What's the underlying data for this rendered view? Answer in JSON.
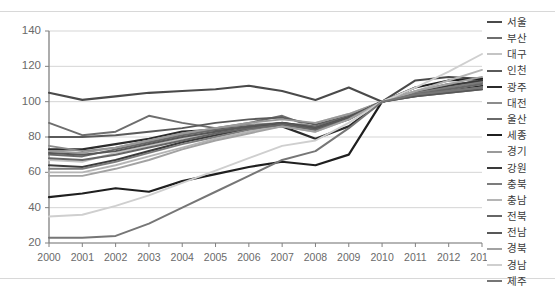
{
  "chart_data": {
    "type": "line",
    "title": "",
    "xlabel": "",
    "ylabel": "",
    "x": [
      2000,
      2001,
      2002,
      2003,
      2004,
      2005,
      2006,
      2007,
      2008,
      2009,
      2010,
      2011,
      2012,
      2013
    ],
    "categories": [
      "2000",
      "2001",
      "2002",
      "2003",
      "2004",
      "2005",
      "2006",
      "2007",
      "2008",
      "2009",
      "2010",
      "2011",
      "2012",
      "2013"
    ],
    "ylim": [
      20,
      140
    ],
    "yticks": [
      20,
      40,
      60,
      80,
      100,
      120,
      140
    ],
    "ytick_labels": [
      "20",
      "40",
      "60",
      "80",
      "100",
      "120",
      "140"
    ],
    "grid": true,
    "grid_axis": "y",
    "legend_position": "right",
    "index_year": 2010,
    "index_value": 100,
    "series": [
      {
        "name": "서울",
        "color": "#4a4a4a",
        "width": 2.1,
        "values": [
          105,
          101,
          103,
          105,
          106,
          107,
          109,
          106,
          101,
          108,
          100,
          112,
          114,
          113
        ]
      },
      {
        "name": "부산",
        "color": "#6e6e6e",
        "width": 1.9,
        "values": [
          88,
          81,
          83,
          92,
          88,
          85,
          88,
          92,
          85,
          91,
          100,
          104,
          108,
          113
        ]
      },
      {
        "name": "대구",
        "color": "#c4c4c4",
        "width": 1.9,
        "values": [
          67,
          66,
          71,
          75,
          79,
          83,
          84,
          86,
          88,
          93,
          100,
          104,
          109,
          111
        ]
      },
      {
        "name": "인천",
        "color": "#5a5a5a",
        "width": 1.9,
        "values": [
          80,
          80,
          81,
          83,
          85,
          88,
          90,
          91,
          87,
          92,
          100,
          106,
          110,
          111
        ]
      },
      {
        "name": "광주",
        "color": "#2b2b2b",
        "width": 2.2,
        "values": [
          73,
          73,
          76,
          79,
          83,
          84,
          86,
          86,
          79,
          86,
          100,
          104,
          106,
          109
        ]
      },
      {
        "name": "대전",
        "color": "#8c8c8c",
        "width": 1.9,
        "values": [
          75,
          72,
          74,
          78,
          82,
          85,
          87,
          88,
          86,
          91,
          100,
          103,
          106,
          108
        ]
      },
      {
        "name": "울산",
        "color": "#6a6a6a",
        "width": 1.9,
        "values": [
          70,
          69,
          73,
          77,
          81,
          84,
          86,
          88,
          86,
          92,
          100,
          103,
          105,
          107
        ]
      },
      {
        "name": "세종",
        "color": "#1f1f1f",
        "width": 2.2,
        "values": [
          46,
          48,
          51,
          49,
          55,
          59,
          63,
          66,
          64,
          70,
          100,
          108,
          112,
          113
        ]
      },
      {
        "name": "경기",
        "color": "#9a9a9a",
        "width": 1.9,
        "values": [
          72,
          71,
          74,
          78,
          82,
          85,
          88,
          90,
          88,
          93,
          100,
          104,
          107,
          110
        ]
      },
      {
        "name": "강원",
        "color": "#3a3a3a",
        "width": 2.1,
        "values": [
          64,
          63,
          67,
          72,
          77,
          81,
          85,
          88,
          85,
          91,
          100,
          105,
          109,
          112
        ]
      },
      {
        "name": "충북",
        "color": "#7c7c7c",
        "width": 1.9,
        "values": [
          62,
          62,
          66,
          71,
          76,
          80,
          84,
          87,
          84,
          90,
          100,
          105,
          108,
          111
        ]
      },
      {
        "name": "충남",
        "color": "#b5b5b5",
        "width": 1.9,
        "values": [
          60,
          60,
          64,
          69,
          74,
          79,
          83,
          86,
          83,
          90,
          100,
          106,
          112,
          118
        ]
      },
      {
        "name": "전북",
        "color": "#666666",
        "width": 2.0,
        "values": [
          68,
          67,
          70,
          74,
          78,
          82,
          85,
          87,
          84,
          90,
          100,
          104,
          107,
          110
        ]
      },
      {
        "name": "전남",
        "color": "#585858",
        "width": 2.0,
        "values": [
          71,
          70,
          72,
          76,
          80,
          83,
          86,
          88,
          85,
          91,
          100,
          103,
          105,
          107
        ]
      },
      {
        "name": "경북",
        "color": "#a2a2a2",
        "width": 1.9,
        "values": [
          58,
          58,
          62,
          67,
          73,
          78,
          82,
          86,
          83,
          90,
          100,
          106,
          110,
          114
        ]
      },
      {
        "name": "경남",
        "color": "#cfcfcf",
        "width": 1.9,
        "values": [
          35,
          36,
          41,
          47,
          54,
          61,
          68,
          75,
          78,
          88,
          100,
          108,
          117,
          127
        ]
      },
      {
        "name": "제주",
        "color": "#767676",
        "width": 2.0,
        "values": [
          23,
          23,
          24,
          31,
          40,
          49,
          58,
          67,
          72,
          85,
          100,
          104,
          106,
          108
        ]
      }
    ]
  },
  "axis": {
    "y_label_color": "#6a6a6a",
    "x_label_color": "#6a6a6a",
    "grid_color": "#d0d0d0",
    "axis_color": "#808080"
  }
}
